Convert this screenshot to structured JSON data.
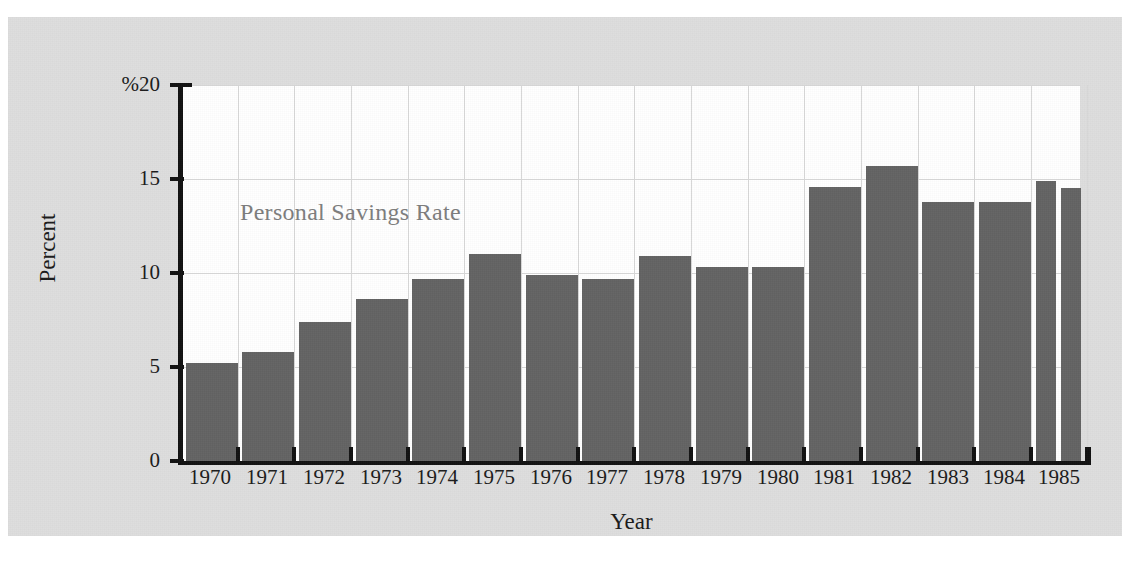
{
  "chart_data": {
    "type": "bar",
    "title": "",
    "annotation": "Personal Savings Rate",
    "xlabel": "Year",
    "ylabel": "Percent",
    "ylim": [
      0,
      20
    ],
    "yticks": [
      0,
      5,
      10,
      15,
      20
    ],
    "ytick_labels": [
      "0",
      "5",
      "10",
      "15",
      "%20"
    ],
    "grid": true,
    "legend": "none",
    "categories": [
      "1970",
      "1971",
      "1972",
      "1973",
      "1974",
      "1975",
      "1976",
      "1977",
      "1978",
      "1979",
      "1980",
      "1981",
      "1982",
      "1983",
      "1984",
      "1985"
    ],
    "values": [
      5.2,
      5.8,
      7.4,
      8.6,
      9.7,
      11.0,
      9.9,
      9.7,
      10.9,
      10.3,
      10.3,
      14.6,
      15.7,
      13.8,
      13.8,
      14.9
    ],
    "bars": [
      {
        "label": "1970",
        "value": 5.2,
        "x": 178,
        "width": 52
      },
      {
        "label": "1971",
        "value": 5.8,
        "x": 234,
        "width": 52
      },
      {
        "label": "1972",
        "value": 7.4,
        "x": 291,
        "width": 52
      },
      {
        "label": "1973",
        "value": 8.6,
        "x": 348,
        "width": 52
      },
      {
        "label": "1974",
        "value": 9.7,
        "x": 404,
        "width": 52
      },
      {
        "label": "1975",
        "value": 11.0,
        "x": 461,
        "width": 52
      },
      {
        "label": "1976",
        "value": 9.9,
        "x": 518,
        "width": 52
      },
      {
        "label": "1977",
        "value": 9.7,
        "x": 574,
        "width": 52
      },
      {
        "label": "1978",
        "value": 10.9,
        "x": 631,
        "width": 52
      },
      {
        "label": "1979",
        "value": 10.3,
        "x": 688,
        "width": 52
      },
      {
        "label": "1980",
        "value": 10.3,
        "x": 744,
        "width": 52
      },
      {
        "label": "1981",
        "value": 14.6,
        "x": 801,
        "width": 52
      },
      {
        "label": "1982",
        "value": 15.7,
        "x": 858,
        "width": 52
      },
      {
        "label": "1983",
        "value": 13.8,
        "x": 914,
        "width": 52
      },
      {
        "label": "1984",
        "value": 13.8,
        "x": 971,
        "width": 52
      },
      {
        "label": "1985Q1",
        "value": 14.9,
        "x": 1028,
        "width": 20
      },
      {
        "label": "1985Q2",
        "value": 14.5,
        "x": 1053,
        "width": 20
      }
    ],
    "xtick_positions": [
      173,
      230,
      286,
      343,
      400,
      456,
      513,
      570,
      626,
      683,
      740,
      796,
      853,
      910,
      966,
      1023,
      1079
    ],
    "xtick_label_positions": [
      {
        "label": "1970",
        "center": 202
      },
      {
        "label": "1971",
        "center": 259
      },
      {
        "label": "1972",
        "center": 316
      },
      {
        "label": "1973",
        "center": 373
      },
      {
        "label": "1974",
        "center": 429
      },
      {
        "label": "1975",
        "center": 486
      },
      {
        "label": "1976",
        "center": 543
      },
      {
        "label": "1977",
        "center": 599
      },
      {
        "label": "1978",
        "center": 656
      },
      {
        "label": "1979",
        "center": 713
      },
      {
        "label": "1980",
        "center": 770
      },
      {
        "label": "1981",
        "center": 826
      },
      {
        "label": "1982",
        "center": 883
      },
      {
        "label": "1983",
        "center": 940
      },
      {
        "label": "1984",
        "center": 996
      },
      {
        "label": "1985",
        "center": 1051
      }
    ],
    "colors": {
      "bar": "#636363",
      "axis": "#111111",
      "grid": "#d8d8d8",
      "panel_background": "#dedede",
      "plot_background": "#ffffff",
      "annotation_text": "#7d7d7d",
      "tick_text": "#1a1a1a"
    }
  }
}
